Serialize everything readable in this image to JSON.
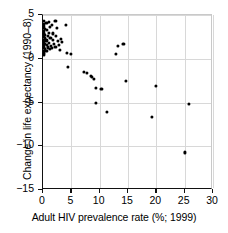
{
  "chart_data": {
    "type": "scatter",
    "title": "",
    "xlabel": "Adult HIV prevalence rate (%; 1999)",
    "ylabel": "Change in life expectancy (1990–8)",
    "xlim": [
      0,
      30
    ],
    "ylim": [
      -15,
      5
    ],
    "xticks": [
      0,
      5,
      10,
      15,
      20,
      25,
      30
    ],
    "yticks": [
      5,
      0,
      -5,
      -10,
      -15
    ],
    "xtick_labels": [
      "0",
      "5",
      "10",
      "15",
      "20",
      "25",
      "30"
    ],
    "ytick_labels": [
      "5",
      "0",
      "−5",
      "−10",
      "−15"
    ],
    "grid": true,
    "legend": null,
    "marker": "filled-circle",
    "marker_color": "#000000",
    "points": [
      {
        "x": 0.1,
        "y": 4.3
      },
      {
        "x": 0.15,
        "y": 4.0
      },
      {
        "x": 0.2,
        "y": 3.8
      },
      {
        "x": 0.1,
        "y": 3.5
      },
      {
        "x": 0.3,
        "y": 3.4
      },
      {
        "x": 0.15,
        "y": 3.2
      },
      {
        "x": 0.2,
        "y": 3.0
      },
      {
        "x": 0.1,
        "y": 2.8
      },
      {
        "x": 0.25,
        "y": 2.7
      },
      {
        "x": 0.1,
        "y": 2.5
      },
      {
        "x": 0.3,
        "y": 2.4
      },
      {
        "x": 0.15,
        "y": 2.2
      },
      {
        "x": 0.2,
        "y": 2.0
      },
      {
        "x": 0.1,
        "y": 1.9
      },
      {
        "x": 0.25,
        "y": 1.7
      },
      {
        "x": 0.1,
        "y": 1.6
      },
      {
        "x": 0.2,
        "y": 1.4
      },
      {
        "x": 0.15,
        "y": 1.2
      },
      {
        "x": 0.3,
        "y": 1.1
      },
      {
        "x": 0.1,
        "y": 0.9
      },
      {
        "x": 0.2,
        "y": 0.7
      },
      {
        "x": 0.15,
        "y": 0.5
      },
      {
        "x": 0.6,
        "y": 4.1
      },
      {
        "x": 0.7,
        "y": 3.3
      },
      {
        "x": 0.8,
        "y": 2.6
      },
      {
        "x": 0.6,
        "y": 2.1
      },
      {
        "x": 0.7,
        "y": 1.6
      },
      {
        "x": 0.9,
        "y": 1.3
      },
      {
        "x": 0.6,
        "y": 0.9
      },
      {
        "x": 1.0,
        "y": 4.2
      },
      {
        "x": 1.2,
        "y": 3.6
      },
      {
        "x": 1.1,
        "y": 3.0
      },
      {
        "x": 1.3,
        "y": 2.4
      },
      {
        "x": 1.1,
        "y": 1.8
      },
      {
        "x": 1.4,
        "y": 1.5
      },
      {
        "x": 1.2,
        "y": 1.1
      },
      {
        "x": 1.6,
        "y": 3.9
      },
      {
        "x": 1.8,
        "y": 2.9
      },
      {
        "x": 1.7,
        "y": 2.2
      },
      {
        "x": 1.9,
        "y": 1.7
      },
      {
        "x": 1.6,
        "y": 1.2
      },
      {
        "x": 2.2,
        "y": 4.3
      },
      {
        "x": 2.4,
        "y": 3.5
      },
      {
        "x": 2.3,
        "y": 2.6
      },
      {
        "x": 2.6,
        "y": 2.0
      },
      {
        "x": 2.2,
        "y": 1.4
      },
      {
        "x": 2.8,
        "y": 1.6
      },
      {
        "x": 3.1,
        "y": 2.3
      },
      {
        "x": 3.3,
        "y": 1.9
      },
      {
        "x": 3.0,
        "y": 1.0
      },
      {
        "x": 4.0,
        "y": 3.9
      },
      {
        "x": 4.2,
        "y": 0.7
      },
      {
        "x": 4.4,
        "y": -0.9
      },
      {
        "x": 4.9,
        "y": 0.6
      },
      {
        "x": 7.2,
        "y": -1.5
      },
      {
        "x": 7.8,
        "y": -1.6
      },
      {
        "x": 8.4,
        "y": -2.0
      },
      {
        "x": 8.7,
        "y": -2.1
      },
      {
        "x": 9.0,
        "y": -2.3
      },
      {
        "x": 9.3,
        "y": -3.3
      },
      {
        "x": 9.4,
        "y": -5.0
      },
      {
        "x": 10.3,
        "y": -3.4
      },
      {
        "x": 11.3,
        "y": -6.1
      },
      {
        "x": 12.8,
        "y": 0.6
      },
      {
        "x": 13.2,
        "y": 1.5
      },
      {
        "x": 14.2,
        "y": 1.7
      },
      {
        "x": 14.7,
        "y": -2.5
      },
      {
        "x": 19.2,
        "y": -6.6
      },
      {
        "x": 19.9,
        "y": -3.1
      },
      {
        "x": 25.1,
        "y": -10.7
      },
      {
        "x": 25.8,
        "y": -5.2
      }
    ]
  }
}
